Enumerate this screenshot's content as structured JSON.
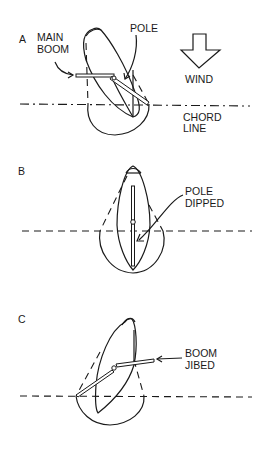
{
  "panels": {
    "a": {
      "letter": "A",
      "labels": {
        "main_boom_1": "MAIN",
        "main_boom_2": "BOOM",
        "pole": "POLE",
        "wind": "WIND",
        "chord_1": "CHORD",
        "chord_2": "LINE"
      }
    },
    "b": {
      "letter": "B",
      "labels": {
        "pole_dipped_1": "POLE",
        "pole_dipped_2": "DIPPED"
      }
    },
    "c": {
      "letter": "C",
      "labels": {
        "boom_jibed_1": "BOOM",
        "boom_jibed_2": "JIBED"
      }
    }
  },
  "colors": {
    "ink": "#1a1a1a",
    "background": "#ffffff"
  }
}
